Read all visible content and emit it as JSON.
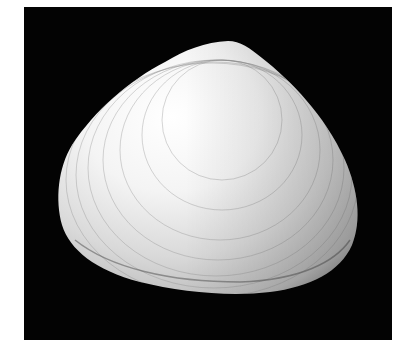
{
  "image": {
    "subject": "Bivalve clam shell photographed on black background",
    "alt": "White clam shell with concentric growth lines on black background",
    "colors": {
      "page_background": "#ffffff",
      "frame_background": "#030303",
      "shell_highlight": "#fbfbfb",
      "shell_mid": "#dcdcdc",
      "shell_shadow": "#9a9a9a",
      "growth_line": "#7a7a7a"
    }
  }
}
